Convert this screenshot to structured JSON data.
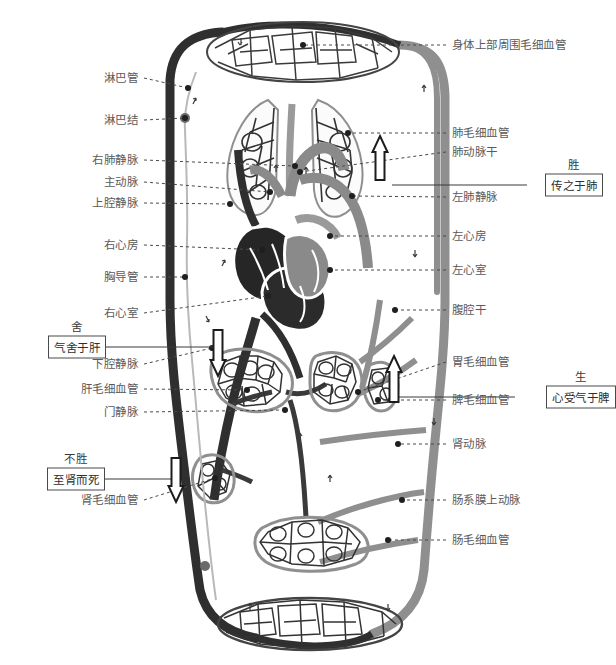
{
  "figure": {
    "type": "anatomical-diagram",
    "colors": {
      "venous_dark": "#2f2f2f",
      "arterial_gray": "#8a8a8a",
      "lymph_gray": "#b9b9b9",
      "label_text": "#5a5a5a",
      "leader_line": "#4a4a4a",
      "box_border": "#4a4a4a",
      "background": "#ffffff"
    }
  },
  "labels_left": [
    {
      "text": "淋巴管",
      "y": 78,
      "tip_x": 188,
      "tip_y": 88,
      "dot": true
    },
    {
      "text": "淋巴结",
      "y": 120,
      "tip_x": 185,
      "tip_y": 118,
      "dot": true
    },
    {
      "text": "右肺静脉",
      "y": 160,
      "tip_x": 295,
      "tip_y": 166,
      "dot": true
    },
    {
      "text": "主动脉",
      "y": 182,
      "tip_x": 270,
      "tip_y": 192,
      "dot": true
    },
    {
      "text": "上腔静脉",
      "y": 203,
      "tip_x": 230,
      "tip_y": 204,
      "dot": true
    },
    {
      "text": "右心房",
      "y": 245,
      "tip_x": 262,
      "tip_y": 250,
      "dot": true
    },
    {
      "text": "胸导管",
      "y": 277,
      "tip_x": 185,
      "tip_y": 277,
      "dot": true
    },
    {
      "text": "右心室",
      "y": 313,
      "tip_x": 268,
      "tip_y": 296,
      "dot": true
    },
    {
      "text": "下腔静脉",
      "y": 364,
      "tip_x": 212,
      "tip_y": 348,
      "dot": true
    },
    {
      "text": "肝毛细血管",
      "y": 389,
      "tip_x": 247,
      "tip_y": 390,
      "dot": true
    },
    {
      "text": "门静脉",
      "y": 412,
      "tip_x": 285,
      "tip_y": 410,
      "dot": true
    },
    {
      "text": "肾毛细血管",
      "y": 500,
      "tip_x": 215,
      "tip_y": 478,
      "dot": true
    }
  ],
  "labels_right": [
    {
      "text": "身体上部周围毛细血管",
      "y": 45,
      "tip_x": 303,
      "tip_y": 45,
      "dot": true
    },
    {
      "text": "肺毛细血管",
      "y": 133,
      "tip_x": 348,
      "tip_y": 133,
      "dot": true
    },
    {
      "text": "肺动脉干",
      "y": 152,
      "tip_x": 300,
      "tip_y": 172,
      "dot": true
    },
    {
      "text": "左肺静脉",
      "y": 197,
      "tip_x": 352,
      "tip_y": 196,
      "dot": true
    },
    {
      "text": "左心房",
      "y": 236,
      "tip_x": 330,
      "tip_y": 236,
      "dot": true
    },
    {
      "text": "左心室",
      "y": 270,
      "tip_x": 330,
      "tip_y": 270,
      "dot": true
    },
    {
      "text": "腹腔干",
      "y": 310,
      "tip_x": 395,
      "tip_y": 310,
      "dot": true
    },
    {
      "text": "胃毛细血管",
      "y": 362,
      "tip_x": 358,
      "tip_y": 392,
      "dot": true
    },
    {
      "text": "脾毛细血管",
      "y": 400,
      "tip_x": 378,
      "tip_y": 400,
      "dot": true
    },
    {
      "text": "肾动脉",
      "y": 444,
      "tip_x": 398,
      "tip_y": 444,
      "dot": true
    },
    {
      "text": "肠系膜上动脉",
      "y": 500,
      "tip_x": 402,
      "tip_y": 500,
      "dot": true
    },
    {
      "text": "肠毛细血管",
      "y": 540,
      "tip_x": 388,
      "tip_y": 540,
      "dot": true
    }
  ],
  "annotations": [
    {
      "id": "sheng",
      "caption": "胜",
      "box": "传之于肺",
      "side": "right",
      "x": 545,
      "y": 176,
      "line_from_x": 392,
      "line_to_x": 527
    },
    {
      "id": "she",
      "caption": "舍",
      "box": "气舍于肝",
      "side": "left",
      "x": 48,
      "y": 338,
      "line_from_x": 86,
      "line_to_x": 222
    },
    {
      "id": "sheng2",
      "caption": "生",
      "box": "心受气于脾",
      "side": "right",
      "x": 546,
      "y": 388,
      "line_from_x": 396,
      "line_to_x": 515
    },
    {
      "id": "busheng",
      "caption": "不胜",
      "box": "至肾而死",
      "side": "left",
      "x": 47,
      "y": 470,
      "line_from_x": 84,
      "line_to_x": 178
    }
  ],
  "flow_arrows": [
    {
      "id": "arrow-lung",
      "direction": "up",
      "x": 380,
      "y": 136,
      "height": 44
    },
    {
      "id": "arrow-liver",
      "direction": "down",
      "x": 218,
      "y": 330,
      "height": 46
    },
    {
      "id": "arrow-spleen",
      "direction": "up",
      "x": 394,
      "y": 356,
      "height": 46
    },
    {
      "id": "arrow-kidney",
      "direction": "down",
      "x": 176,
      "y": 458,
      "height": 44
    }
  ],
  "organs": [
    {
      "name": "上部毛细血管网",
      "kind": "capillary-bed",
      "cx": 300,
      "cy": 55
    },
    {
      "name": "右肺",
      "kind": "lung",
      "cx": 258,
      "cy": 148
    },
    {
      "name": "左肺",
      "kind": "lung",
      "cx": 330,
      "cy": 148
    },
    {
      "name": "心脏",
      "kind": "heart",
      "cx": 285,
      "cy": 262
    },
    {
      "name": "肝",
      "kind": "capillary-bed",
      "cx": 248,
      "cy": 382
    },
    {
      "name": "胃",
      "kind": "capillary-bed",
      "cx": 330,
      "cy": 382
    },
    {
      "name": "脾",
      "kind": "capillary-bed",
      "cx": 382,
      "cy": 392
    },
    {
      "name": "肾",
      "kind": "capillary-bed",
      "cx": 213,
      "cy": 478
    },
    {
      "name": "肠",
      "kind": "capillary-bed",
      "cx": 305,
      "cy": 540
    },
    {
      "name": "下部毛细血管网",
      "kind": "capillary-bed",
      "cx": 310,
      "cy": 625
    }
  ]
}
